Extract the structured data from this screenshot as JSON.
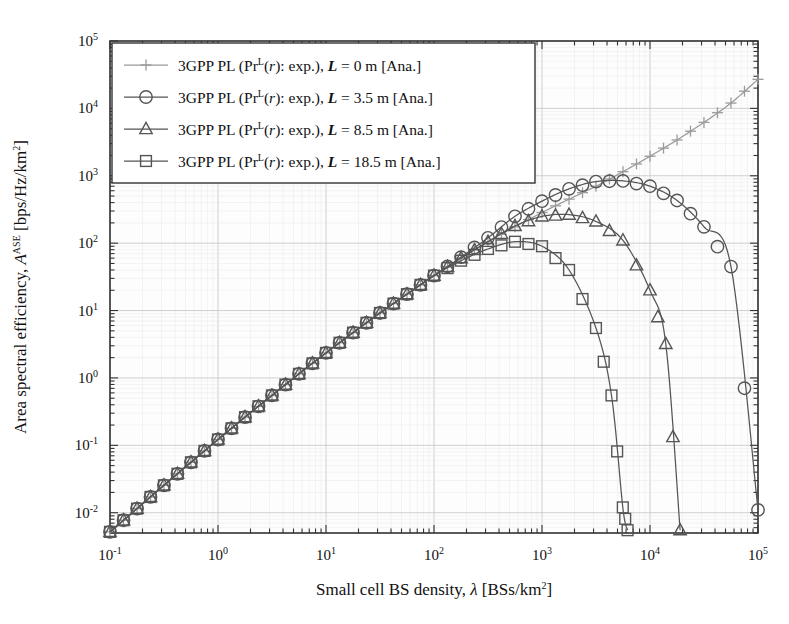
{
  "chart_data": {
    "type": "line",
    "title": "",
    "xlabel": "Small cell BS density, λ [BSs/km2]",
    "ylabel": "Area spectral efficiency, AASE [bps/Hz/km2]",
    "xscale": "log",
    "yscale": "log",
    "xlim": [
      0.1,
      100000
    ],
    "ylim": [
      0.005,
      100000
    ],
    "xticks": [
      "10-1",
      "100",
      "101",
      "102",
      "103",
      "104",
      "105"
    ],
    "xtick_values": [
      0.1,
      1,
      10,
      100,
      1000,
      10000,
      100000
    ],
    "yticks": [
      "10-2",
      "10-1",
      "100",
      "101",
      "102",
      "103",
      "104",
      "105"
    ],
    "ytick_values": [
      0.01,
      0.1,
      1,
      10,
      100,
      1000,
      10000,
      100000
    ],
    "grid": true,
    "legend_position": "upper-left",
    "series": [
      {
        "name": "3GPP PL (PrL(r): exp.), L = 0 m [Ana.]",
        "marker": "plus",
        "L": 0,
        "x": [
          0.1,
          0.178,
          0.316,
          0.562,
          1,
          1.78,
          3.16,
          5.62,
          10,
          17.8,
          31.6,
          56.2,
          100,
          178,
          316,
          562,
          1000,
          1780,
          3160,
          5620,
          10000,
          17800,
          31600,
          56200,
          100000
        ],
        "y": [
          0.0052,
          0.0115,
          0.0255,
          0.056,
          0.122,
          0.262,
          0.55,
          1.15,
          2.35,
          4.7,
          9.2,
          17.5,
          33,
          60,
          105,
          175,
          285,
          450,
          700,
          1150,
          1950,
          3400,
          6200,
          12000,
          27000
        ]
      },
      {
        "name": "3GPP PL (PrL(r): exp.), L = 3.5 m [Ana.]",
        "marker": "circle",
        "L": 3.5,
        "x": [
          0.1,
          0.178,
          0.316,
          0.562,
          1,
          1.78,
          3.16,
          5.62,
          10,
          17.8,
          31.6,
          56.2,
          100,
          178,
          316,
          562,
          1000,
          1780,
          3160,
          5620,
          10000,
          17800,
          31600,
          56200,
          100000
        ],
        "y": [
          0.0052,
          0.0115,
          0.0255,
          0.056,
          0.122,
          0.262,
          0.55,
          1.15,
          2.35,
          4.7,
          9.2,
          17.5,
          33,
          62,
          120,
          250,
          420,
          640,
          820,
          840,
          700,
          430,
          175,
          45,
          0.011
        ]
      },
      {
        "name": "3GPP PL (PrL(r): exp.), L = 8.5 m [Ana.]",
        "marker": "triangle",
        "L": 8.5,
        "x": [
          0.1,
          0.178,
          0.316,
          0.562,
          1,
          1.78,
          3.16,
          5.62,
          10,
          17.8,
          31.6,
          56.2,
          100,
          178,
          316,
          562,
          1000,
          1780,
          3160,
          5620,
          10000,
          14000,
          19000
        ],
        "y": [
          0.0052,
          0.0115,
          0.0255,
          0.056,
          0.122,
          0.262,
          0.55,
          1.15,
          2.35,
          4.7,
          9.2,
          17.5,
          33,
          60,
          105,
          180,
          250,
          265,
          210,
          110,
          20,
          3.2,
          0.0055
        ]
      },
      {
        "name": "3GPP PL (PrL(r): exp.), L = 18.5 m [Ana.]",
        "marker": "square",
        "L": 18.5,
        "x": [
          0.1,
          0.178,
          0.316,
          0.562,
          1,
          1.78,
          3.16,
          5.62,
          10,
          17.8,
          31.6,
          56.2,
          100,
          178,
          316,
          562,
          1000,
          1780,
          3160,
          4400,
          5600,
          6200
        ],
        "y": [
          0.0052,
          0.0115,
          0.0255,
          0.056,
          0.122,
          0.262,
          0.55,
          1.15,
          2.35,
          4.7,
          9.2,
          17.5,
          33,
          55,
          82,
          105,
          90,
          40,
          5.5,
          0.55,
          0.012,
          0.0055
        ]
      }
    ]
  },
  "axes": {
    "xlabel_parts": {
      "text1": "Small cell BS density, ",
      "lambda": "λ",
      "text2": " [BSs/km",
      "exp": "2",
      "text3": "]"
    },
    "ylabel_parts": {
      "text1": "Area spectral efficiency, ",
      "symbol": "A",
      "sup": "ASE",
      "text2": " [bps/Hz/km",
      "exp": "2",
      "text3": "]"
    }
  },
  "legend": {
    "entries": [
      {
        "prefix": "3GPP PL (Pr",
        "sup": "L",
        "mid": "(",
        "var": "r",
        "mid2": "): exp.), ",
        "lvar": "L",
        "eq": " = ",
        "value": "0",
        "unit": " m [Ana.]",
        "marker": "plus"
      },
      {
        "prefix": "3GPP PL (Pr",
        "sup": "L",
        "mid": "(",
        "var": "r",
        "mid2": "): exp.), ",
        "lvar": "L",
        "eq": " = ",
        "value": "3.5",
        "unit": " m [Ana.]",
        "marker": "circle"
      },
      {
        "prefix": "3GPP PL (Pr",
        "sup": "L",
        "mid": "(",
        "var": "r",
        "mid2": "): exp.), ",
        "lvar": "L",
        "eq": " = ",
        "value": "8.5",
        "unit": " m [Ana.]",
        "marker": "triangle"
      },
      {
        "prefix": "3GPP PL (Pr",
        "sup": "L",
        "mid": "(",
        "var": "r",
        "mid2": "): exp.), ",
        "lvar": "L",
        "eq": " = ",
        "value": "18.5",
        "unit": " m [Ana.]",
        "marker": "square"
      }
    ]
  },
  "style": {
    "line_color": "#555555",
    "line_color_light": "#9a9a9a",
    "axis_color": "#333333",
    "grid_color": "#d8d8d8",
    "background": "#ffffff",
    "plot_background": "#fdfdfd"
  }
}
